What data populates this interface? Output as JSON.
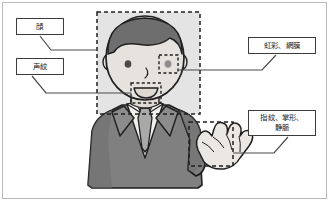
{
  "callouts": [
    {
      "id": "face",
      "label": "顔",
      "target": "face-region"
    },
    {
      "id": "voiceprint",
      "label": "声紋",
      "target": "mouth-region"
    },
    {
      "id": "iris",
      "label": "虹彩、網膜",
      "target": "eye-region"
    },
    {
      "id": "hand",
      "label": "指紋、掌形、\n静脈",
      "target": "hand-region"
    }
  ],
  "regions": [
    {
      "id": "face-region",
      "name": "face-highlight-box"
    },
    {
      "id": "mouth-region",
      "name": "mouth-highlight-box"
    },
    {
      "id": "eye-region",
      "name": "eye-highlight-box"
    },
    {
      "id": "hand-region",
      "name": "hand-highlight-box"
    }
  ],
  "colors": {
    "hair": "#6e6e6e",
    "skin": "#e6e3de",
    "suit": "#808080",
    "suit_shadow": "#6d6d6d",
    "shirt": "#f2f0ec",
    "tie": "#a9a9a9",
    "highlight_fill": "#e4e4e4",
    "outline": "#1f1f1f",
    "frame_border": "#b9b9b9",
    "callout_border": "#3b3b3b",
    "connector": "#4a4a4a"
  }
}
